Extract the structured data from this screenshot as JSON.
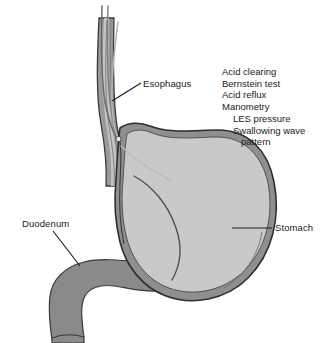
{
  "figure": {
    "type": "anatomical-diagram",
    "background_color": "#ffffff"
  },
  "colors": {
    "outline": "#3a3a3a",
    "stomach_fill": "#c9c9c9",
    "stomach_wall": "#8f8f8f",
    "duodenum_fill": "#8a8a8a",
    "esophagus_wall": "#9a9a9a",
    "esophagus_lumen": "#bfbfbf",
    "catheter": "#9c9c9c",
    "catheter_dark": "#555555",
    "text": "#222222",
    "leader_line": "#1a1a1a"
  },
  "labels": {
    "esophagus": "Esophagus",
    "duodenum": "Duodenum",
    "stomach": "Stomach"
  },
  "test_list": {
    "items": [
      {
        "text": "Acid clearing",
        "indent": 0
      },
      {
        "text": "Bernstein test",
        "indent": 0
      },
      {
        "text": "Acid reflux",
        "indent": 0
      },
      {
        "text": "Manometry",
        "indent": 0
      },
      {
        "text": "LES pressure",
        "indent": 1
      },
      {
        "text": "Swallowing wave",
        "indent": 1
      },
      {
        "text": "pattern",
        "indent": 2
      }
    ]
  },
  "structures": [
    {
      "name": "esophagus",
      "description": "vertical tube entering stomach from above"
    },
    {
      "name": "stomach",
      "description": "large ovoid body, fundus, corpus and antrum"
    },
    {
      "name": "duodenum",
      "description": "C-shaped tube exiting stomach at pylorus toward lower left"
    },
    {
      "name": "catheter",
      "description": "manometry probe passing through esophagus with tip at the gastroesophageal junction"
    },
    {
      "name": "rugal-fold",
      "description": "curved fold line inside stomach body"
    }
  ]
}
